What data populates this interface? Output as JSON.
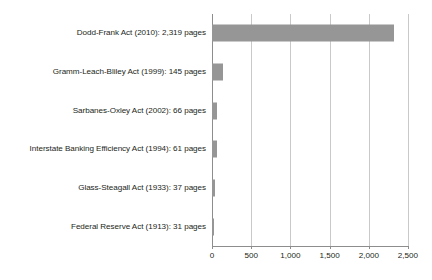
{
  "chart_data": {
    "type": "bar",
    "orientation": "horizontal",
    "title": "",
    "subtitle": "",
    "xlabel": "",
    "ylabel": "",
    "categories": [
      "Dodd-Frank Act (2010): 2,319 pages",
      "Gramm-Leach-Bliley Act (1999): 145 pages",
      "Sarbanes-Oxley Act (2002): 66 pages",
      "Interstate Banking Efficiency Act (1994): 61 pages",
      "Glass-Steagall Act (1933): 37 pages",
      "Federal Reserve Act (1913): 31 pages"
    ],
    "values": [
      2319,
      145,
      66,
      61,
      37,
      31
    ],
    "xlim": [
      0,
      2500
    ],
    "xticks": [
      0,
      500,
      1000,
      1500,
      2000,
      2500
    ],
    "xtick_labels": [
      "0",
      "500",
      "1,000",
      "1,500",
      "2,000",
      "2,500"
    ],
    "grid": true,
    "grid_axis": "x",
    "legend": false,
    "legend_position": "none",
    "bar_color": "#969696",
    "axis_color": "#8d8d8d",
    "grid_color": "#c9c9c9",
    "text_color": "#231f20",
    "background_color": "#ffffff"
  }
}
